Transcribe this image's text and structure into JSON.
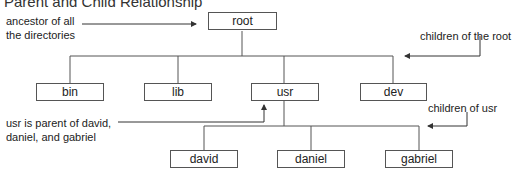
{
  "title": "Parent and Child Relationship",
  "nodes": {
    "root": "root",
    "bin": "bin",
    "lib": "lib",
    "usr": "usr",
    "dev": "dev",
    "david": "david",
    "daniel": "daniel",
    "gabriel": "gabriel"
  },
  "annotations": {
    "ancestor": "ancestor of all\nthe directories",
    "children_of_root": "children of the root",
    "usr_parent": "usr is parent of david,\ndaniel, and gabriel",
    "children_of_usr": "children of usr"
  },
  "colors": {
    "line": "#555555",
    "text": "#222222"
  }
}
